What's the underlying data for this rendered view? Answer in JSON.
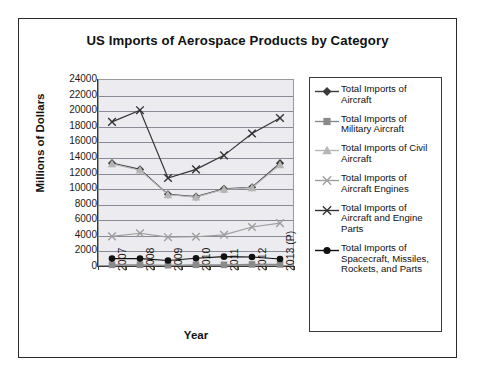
{
  "chart_data": {
    "type": "line",
    "title": "US Imports of Aerospace Products by Category",
    "xlabel": "Year",
    "ylabel": "Millions of Dollars",
    "categories": [
      "2007",
      "2008",
      "2009",
      "2010",
      "2011",
      "2012",
      "2013 (P)"
    ],
    "ylim": [
      0,
      24000
    ],
    "ytick_step": 2000,
    "yticks": [
      "24000",
      "22000",
      "20000",
      "18000",
      "16000",
      "14000",
      "12000",
      "10000",
      "8000",
      "6000",
      "4000",
      "2000",
      "0"
    ],
    "grid": true,
    "legend_position": "right",
    "series": [
      {
        "name": "Total Imports of Aircraft",
        "marker": "diamond",
        "color": "#3b3b3b",
        "values": [
          13200,
          12400,
          9200,
          8900,
          9900,
          10100,
          13200
        ]
      },
      {
        "name": "Total Imports of Military Aircraft",
        "marker": "square",
        "color": "#8a8a8a",
        "values": [
          150,
          150,
          100,
          150,
          150,
          200,
          200
        ]
      },
      {
        "name": "Total Imports of Civil Aircraft",
        "marker": "triangle",
        "color": "#b5b5b5",
        "values": [
          13100,
          12300,
          9150,
          8850,
          9850,
          10050,
          13000
        ]
      },
      {
        "name": "Total Imports of Aircraft Engines",
        "marker": "cross",
        "color": "#9e9e9e",
        "values": [
          3800,
          4200,
          3700,
          3750,
          4000,
          5000,
          5500
        ]
      },
      {
        "name": "Total Imports of Aircraft and Engine Parts",
        "marker": "cross",
        "color": "#333333",
        "values": [
          18500,
          20000,
          11300,
          12400,
          14200,
          17000,
          19000
        ]
      },
      {
        "name": "Total Imports of Spacecraft, Missiles, Rockets, and Parts",
        "marker": "circle",
        "color": "#111111",
        "values": [
          950,
          950,
          700,
          1000,
          1200,
          1150,
          900
        ]
      }
    ]
  },
  "legend": {
    "items": [
      "Total Imports of Aircraft",
      "Total Imports of Military Aircraft",
      "Total Imports of Civil Aircraft",
      "Total Imports of Aircraft Engines",
      "Total Imports of Aircraft and Engine Parts",
      "Total Imports of Spacecraft, Missiles, Rockets, and Parts"
    ]
  }
}
